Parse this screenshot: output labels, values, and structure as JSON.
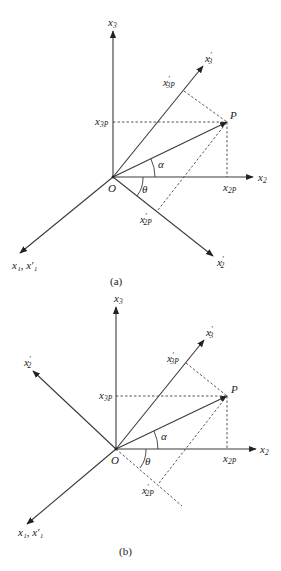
{
  "figure": {
    "panels": [
      {
        "id": "a",
        "caption": "(a)",
        "origin_label": "O",
        "point_label": "P",
        "angle_alpha": "α",
        "angle_theta": "θ",
        "labels": {
          "x3": {
            "base": "x",
            "sub": "3",
            "prime": ""
          },
          "x3p": {
            "base": "x",
            "sub": "3",
            "prime": "′"
          },
          "x3P": {
            "base": "x",
            "sub": "3P",
            "prime": ""
          },
          "x3pP": {
            "base": "x",
            "sub": "3P",
            "prime": "′"
          },
          "x2": {
            "base": "x",
            "sub": "2",
            "prime": ""
          },
          "x2P": {
            "base": "x",
            "sub": "2P",
            "prime": ""
          },
          "x2p": {
            "base": "x",
            "sub": "2",
            "prime": "′"
          },
          "x2pP": {
            "base": "x",
            "sub": "2P",
            "prime": "′"
          },
          "x1": "x₁, x′₁"
        }
      },
      {
        "id": "b",
        "caption": "(b)",
        "origin_label": "O",
        "point_label": "P",
        "angle_alpha": "α",
        "angle_theta": "θ",
        "labels": {
          "x3": {
            "base": "x",
            "sub": "3",
            "prime": ""
          },
          "x3p": {
            "base": "x",
            "sub": "3",
            "prime": "′"
          },
          "x3P": {
            "base": "x",
            "sub": "3P",
            "prime": ""
          },
          "x3pP": {
            "base": "x",
            "sub": "3P",
            "prime": "′"
          },
          "x2": {
            "base": "x",
            "sub": "2",
            "prime": ""
          },
          "x2P": {
            "base": "x",
            "sub": "2P",
            "prime": ""
          },
          "x2p": {
            "base": "x",
            "sub": "2",
            "prime": "′"
          },
          "x2pP": {
            "base": "x",
            "sub": "2P",
            "prime": "′"
          },
          "x1": "x₁, x′₁"
        }
      }
    ]
  }
}
